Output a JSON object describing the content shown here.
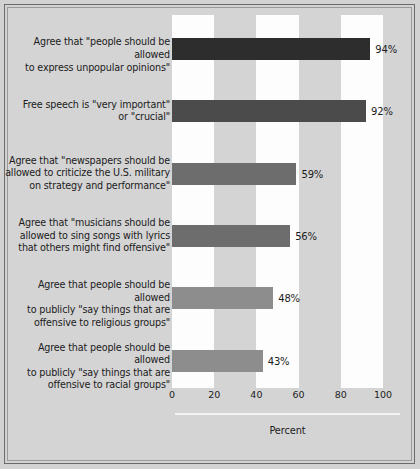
{
  "chart_data": {
    "type": "bar",
    "orientation": "horizontal",
    "title": "",
    "xlabel": "Percent",
    "ylabel": "",
    "xlim": [
      0,
      100
    ],
    "xticks": [
      0,
      20,
      40,
      60,
      80,
      100
    ],
    "xtick_labels": [
      "0",
      "20",
      "40",
      "60",
      "80",
      "100"
    ],
    "grid": false,
    "alternating_bands": true,
    "legend": null,
    "categories": [
      "Agree that \"people should be allowed\nto express unpopular opinions\"",
      "Free speech is \"very important\"\nor \"crucial\"",
      "Agree that \"newspapers should be\nallowed to criticize the U.S. military\non strategy and performance\"",
      "Agree that \"musicians should be\nallowed to sing songs with lyrics\nthat others might find offensive\"",
      "Agree that people should be allowed\nto publicly \"say things that are\noffensive to religious groups\"",
      "Agree that people should be allowed\nto publicly \"say things that are\noffensive to racial groups\""
    ],
    "values": [
      94,
      92,
      59,
      56,
      48,
      43
    ],
    "value_labels": [
      "94%",
      "92%",
      "59%",
      "56%",
      "48%",
      "43%"
    ],
    "bar_colors": [
      "#2d2d2d",
      "#4b4b4b",
      "#6d6d6d",
      "#6d6d6d",
      "#8d8d8d",
      "#8d8d8d"
    ]
  },
  "style": {
    "figure_background": "#d2d2d2",
    "band_white": "#fdfdfd",
    "band_gray": "#d4d4d4",
    "text_color": "#1b1b1b",
    "rule_color": "#f2f2f2"
  }
}
